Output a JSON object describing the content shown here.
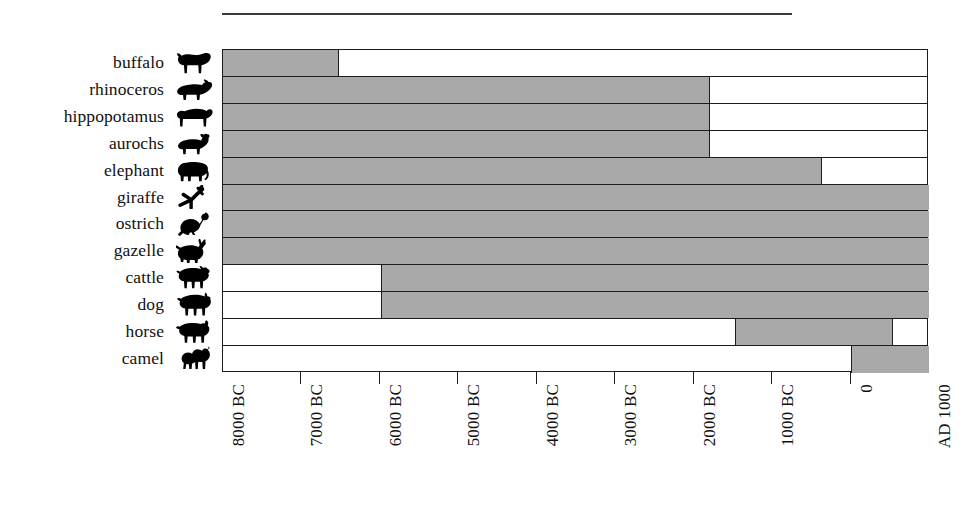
{
  "chart_data": {
    "type": "bar",
    "orientation": "horizontal",
    "title": "",
    "subtitle": "",
    "xlabel": "",
    "ylabel": "",
    "grid": false,
    "legend": "none",
    "bar_style": "range bars (start year to end year)",
    "bar_fill_color": "#a9a9a9",
    "bar_border_color": "#1c1c1c",
    "axis_type": "time",
    "xlim": [
      -8000,
      1000
    ],
    "xlim_labels": [
      "8000 BC",
      "AD 1000"
    ],
    "tick_values": [
      -8000,
      -7000,
      -6000,
      -5000,
      -4000,
      -3000,
      -2000,
      -1000,
      0,
      1000
    ],
    "tick_labels": [
      "8000 BC",
      "7000 BC",
      "6000 BC",
      "5000 BC",
      "4000 BC",
      "3000 BC",
      "2000 BC",
      "1000 BC",
      "0",
      "AD 1000"
    ],
    "categories": [
      "buffalo",
      "rhinoceros",
      "hippopotamus",
      "aurochs",
      "elephant",
      "giraffe",
      "ostrich",
      "gazelle",
      "cattle",
      "dog",
      "horse",
      "camel"
    ],
    "bars": [
      {
        "category": "buffalo",
        "icon": "buffalo-icon",
        "start": -8000,
        "end": -6525,
        "start_label": "8000 BC",
        "end_label": "6500 BC"
      },
      {
        "category": "rhinoceros",
        "icon": "rhinoceros-icon",
        "start": -8000,
        "end": -1790,
        "start_label": "8000 BC",
        "end_label": "1800 BC"
      },
      {
        "category": "hippopotamus",
        "icon": "hippopotamus-icon",
        "start": -8000,
        "end": -1790,
        "start_label": "8000 BC",
        "end_label": "1800 BC"
      },
      {
        "category": "aurochs",
        "icon": "aurochs-icon",
        "start": -8000,
        "end": -1790,
        "start_label": "8000 BC",
        "end_label": "1800 BC"
      },
      {
        "category": "elephant",
        "icon": "elephant-icon",
        "start": -8000,
        "end": -360,
        "start_label": "8000 BC",
        "end_label": "400 BC"
      },
      {
        "category": "giraffe",
        "icon": "giraffe-icon",
        "start": -8000,
        "end": 1000,
        "start_label": "8000 BC",
        "end_label": "AD 1000"
      },
      {
        "category": "ostrich",
        "icon": "ostrich-icon",
        "start": -8000,
        "end": 1000,
        "start_label": "8000 BC",
        "end_label": "AD 1000"
      },
      {
        "category": "gazelle",
        "icon": "gazelle-icon",
        "start": -8000,
        "end": 1000,
        "start_label": "8000 BC",
        "end_label": "AD 1000"
      },
      {
        "category": "cattle",
        "icon": "cattle-icon",
        "start": -5990,
        "end": 1000,
        "start_label": "6000 BC",
        "end_label": "AD 1000"
      },
      {
        "category": "dog",
        "icon": "dog-icon",
        "start": -5990,
        "end": 1000,
        "start_label": "6000 BC",
        "end_label": "AD 1000"
      },
      {
        "category": "horse",
        "icon": "horse-icon",
        "start": -1475,
        "end": 545,
        "start_label": "1500 BC",
        "end_label": "AD 500"
      },
      {
        "category": "camel",
        "icon": "camel-icon",
        "start": 0,
        "end": 1000,
        "start_label": "0",
        "end_label": "AD 1000"
      }
    ]
  },
  "rows": [
    {
      "label": "buffalo",
      "icon": "buffalo-icon"
    },
    {
      "label": "rhinoceros",
      "icon": "rhinoceros-icon"
    },
    {
      "label": "hippopotamus",
      "icon": "hippopotamus-icon"
    },
    {
      "label": "aurochs",
      "icon": "aurochs-icon"
    },
    {
      "label": "elephant",
      "icon": "elephant-icon"
    },
    {
      "label": "giraffe",
      "icon": "giraffe-icon"
    },
    {
      "label": "ostrich",
      "icon": "ostrich-icon"
    },
    {
      "label": "gazelle",
      "icon": "gazelle-icon"
    },
    {
      "label": "cattle",
      "icon": "cattle-icon"
    },
    {
      "label": "dog",
      "icon": "dog-icon"
    },
    {
      "label": "horse",
      "icon": "horse-icon"
    },
    {
      "label": "camel",
      "icon": "camel-icon"
    }
  ]
}
